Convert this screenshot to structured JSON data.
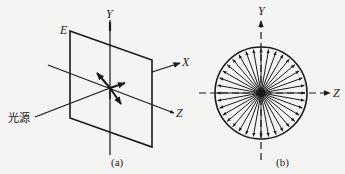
{
  "figure_a": {
    "caption": "(a)",
    "plane_label": "E",
    "axis_y_label": "Y",
    "axis_x_label": "X",
    "axis_z_label": "Z",
    "light_source_label": "光源"
  },
  "figure_b": {
    "caption": "(b)",
    "axis_y_label": "Y",
    "axis_z_label": "Z",
    "radial_arrow_count": 36
  },
  "colors": {
    "ink": "#1a1a1a",
    "paper": "#f4f4f2"
  }
}
